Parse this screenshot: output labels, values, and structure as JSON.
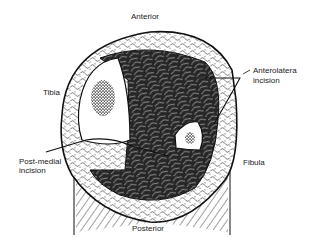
{
  "figure": {
    "labels": {
      "anterior": "Anterior",
      "posterior": "Posterior",
      "tibia": "Tibia",
      "fibula": "Fibula",
      "anterolateral_line1": "Anterolatera",
      "anterolateral_line2": "incision",
      "postmedial_line1": "Post-medial",
      "postmedial_line2": "incision"
    },
    "colors": {
      "ink": "#111111",
      "muscle": "#2a2a2a",
      "background": "#ffffff"
    }
  }
}
